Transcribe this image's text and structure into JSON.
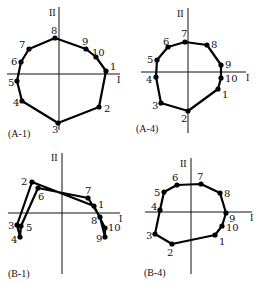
{
  "figure": {
    "panels": [
      {
        "id": "A-1",
        "caption": "(A-1)",
        "caption_pos": [
          8,
          137
        ],
        "axis_labels": {
          "vertical": "II",
          "horizontal": "I"
        },
        "v_axis": {
          "x": 59,
          "y1": 7,
          "y2": 130
        },
        "h_axis": {
          "y": 74,
          "x1": 7,
          "x2": 120
        },
        "v_label_pos": [
          49,
          16
        ],
        "h_label_pos": [
          117,
          83
        ],
        "order": [
          "1",
          "2",
          "3",
          "4",
          "5",
          "6",
          "7",
          "8",
          "9",
          "10"
        ],
        "points": [
          {
            "label": "1",
            "x": 106,
            "y": 71,
            "lx": 110,
            "ly": 70
          },
          {
            "label": "2",
            "x": 99,
            "y": 107,
            "lx": 104,
            "ly": 112
          },
          {
            "label": "3",
            "x": 58,
            "y": 123,
            "lx": 52,
            "ly": 133
          },
          {
            "label": "4",
            "x": 22,
            "y": 101,
            "lx": 13,
            "ly": 106
          },
          {
            "label": "5",
            "x": 17,
            "y": 81,
            "lx": 8,
            "ly": 86
          },
          {
            "label": "6",
            "x": 21,
            "y": 62,
            "lx": 11,
            "ly": 65
          },
          {
            "label": "7",
            "x": 29,
            "y": 49,
            "lx": 19,
            "ly": 48
          },
          {
            "label": "8",
            "x": 55,
            "y": 38,
            "lx": 51,
            "ly": 34
          },
          {
            "label": "9",
            "x": 86,
            "y": 49,
            "lx": 82,
            "ly": 45
          },
          {
            "label": "10",
            "x": 96,
            "y": 57,
            "lx": 92,
            "ly": 56
          }
        ]
      },
      {
        "id": "A-4",
        "caption": "(A-4)",
        "caption_pos": [
          136,
          132
        ],
        "axis_labels": {
          "vertical": "II",
          "horizontal": "I"
        },
        "v_axis": {
          "x": 188,
          "y1": 8,
          "y2": 133
        },
        "h_axis": {
          "y": 72,
          "x1": 141,
          "x2": 246
        },
        "v_label_pos": [
          177,
          17
        ],
        "h_label_pos": [
          246,
          81
        ],
        "order": [
          "1",
          "2",
          "3",
          "4",
          "5",
          "6",
          "7",
          "8",
          "9",
          "10"
        ],
        "points": [
          {
            "label": "1",
            "x": 218,
            "y": 89,
            "lx": 222,
            "ly": 98
          },
          {
            "label": "2",
            "x": 188,
            "y": 111,
            "lx": 181,
            "ly": 122
          },
          {
            "label": "3",
            "x": 161,
            "y": 103,
            "lx": 152,
            "ly": 109
          },
          {
            "label": "4",
            "x": 156,
            "y": 77,
            "lx": 146,
            "ly": 83
          },
          {
            "label": "5",
            "x": 157,
            "y": 60,
            "lx": 147,
            "ly": 63
          },
          {
            "label": "6",
            "x": 168,
            "y": 47,
            "lx": 163,
            "ly": 45
          },
          {
            "label": "7",
            "x": 185,
            "y": 42,
            "lx": 181,
            "ly": 37
          },
          {
            "label": "8",
            "x": 207,
            "y": 45,
            "lx": 211,
            "ly": 48
          },
          {
            "label": "9",
            "x": 221,
            "y": 65,
            "lx": 225,
            "ly": 68
          },
          {
            "label": "10",
            "x": 221,
            "y": 78,
            "lx": 225,
            "ly": 82
          }
        ]
      },
      {
        "id": "B-1",
        "caption": "(B-1)",
        "caption_pos": [
          8,
          277
        ],
        "axis_labels": {
          "vertical": "II",
          "horizontal": "I"
        },
        "v_axis": {
          "x": 62,
          "y1": 153,
          "y2": 274
        },
        "h_axis": {
          "y": 213,
          "x1": 8,
          "x2": 120
        },
        "v_label_pos": [
          51,
          161
        ],
        "h_label_pos": [
          119,
          222
        ],
        "order": [
          "1",
          "2",
          "3",
          "4",
          "5",
          "6",
          "7",
          "8",
          "9",
          "10"
        ],
        "points": [
          {
            "label": "1",
            "x": 94,
            "y": 206,
            "lx": 98,
            "ly": 208
          },
          {
            "label": "2",
            "x": 32,
            "y": 182,
            "lx": 21,
            "ly": 185
          },
          {
            "label": "3",
            "x": 17,
            "y": 225,
            "lx": 8,
            "ly": 229
          },
          {
            "label": "4",
            "x": 20,
            "y": 237,
            "lx": 11,
            "ly": 243
          },
          {
            "label": "5",
            "x": 21,
            "y": 226,
            "lx": 26,
            "ly": 231
          },
          {
            "label": "6",
            "x": 38,
            "y": 188,
            "lx": 38,
            "ly": 200
          },
          {
            "label": "7",
            "x": 88,
            "y": 198,
            "lx": 85,
            "ly": 194
          },
          {
            "label": "8",
            "x": 100,
            "y": 217,
            "lx": 91,
            "ly": 224
          },
          {
            "label": "9",
            "x": 105,
            "y": 237,
            "lx": 96,
            "ly": 242
          },
          {
            "label": "10",
            "x": 105,
            "y": 228,
            "lx": 108,
            "ly": 231
          }
        ]
      },
      {
        "id": "B-4",
        "caption": "(B-4)",
        "caption_pos": [
          144,
          276
        ],
        "axis_labels": {
          "vertical": "II",
          "horizontal": "I"
        },
        "v_axis": {
          "x": 191,
          "y1": 158,
          "y2": 274
        },
        "h_axis": {
          "y": 212,
          "x1": 145,
          "x2": 252
        },
        "v_label_pos": [
          180,
          167
        ],
        "h_label_pos": [
          250,
          221
        ],
        "order": [
          "1",
          "2",
          "3",
          "4",
          "5",
          "6",
          "7",
          "8",
          "9",
          "10"
        ],
        "points": [
          {
            "label": "1",
            "x": 215,
            "y": 235,
            "lx": 219,
            "ly": 245
          },
          {
            "label": "2",
            "x": 172,
            "y": 244,
            "lx": 167,
            "ly": 256
          },
          {
            "label": "3",
            "x": 155,
            "y": 234,
            "lx": 146,
            "ly": 239
          },
          {
            "label": "4",
            "x": 160,
            "y": 210,
            "lx": 151,
            "ly": 210
          },
          {
            "label": "5",
            "x": 164,
            "y": 192,
            "lx": 154,
            "ly": 196
          },
          {
            "label": "6",
            "x": 177,
            "y": 185,
            "lx": 172,
            "ly": 181
          },
          {
            "label": "7",
            "x": 201,
            "y": 184,
            "lx": 197,
            "ly": 180
          },
          {
            "label": "8",
            "x": 220,
            "y": 193,
            "lx": 224,
            "ly": 197
          },
          {
            "label": "9",
            "x": 226,
            "y": 213,
            "lx": 229,
            "ly": 222
          },
          {
            "label": "10",
            "x": 222,
            "y": 226,
            "lx": 226,
            "ly": 231
          }
        ]
      }
    ]
  }
}
